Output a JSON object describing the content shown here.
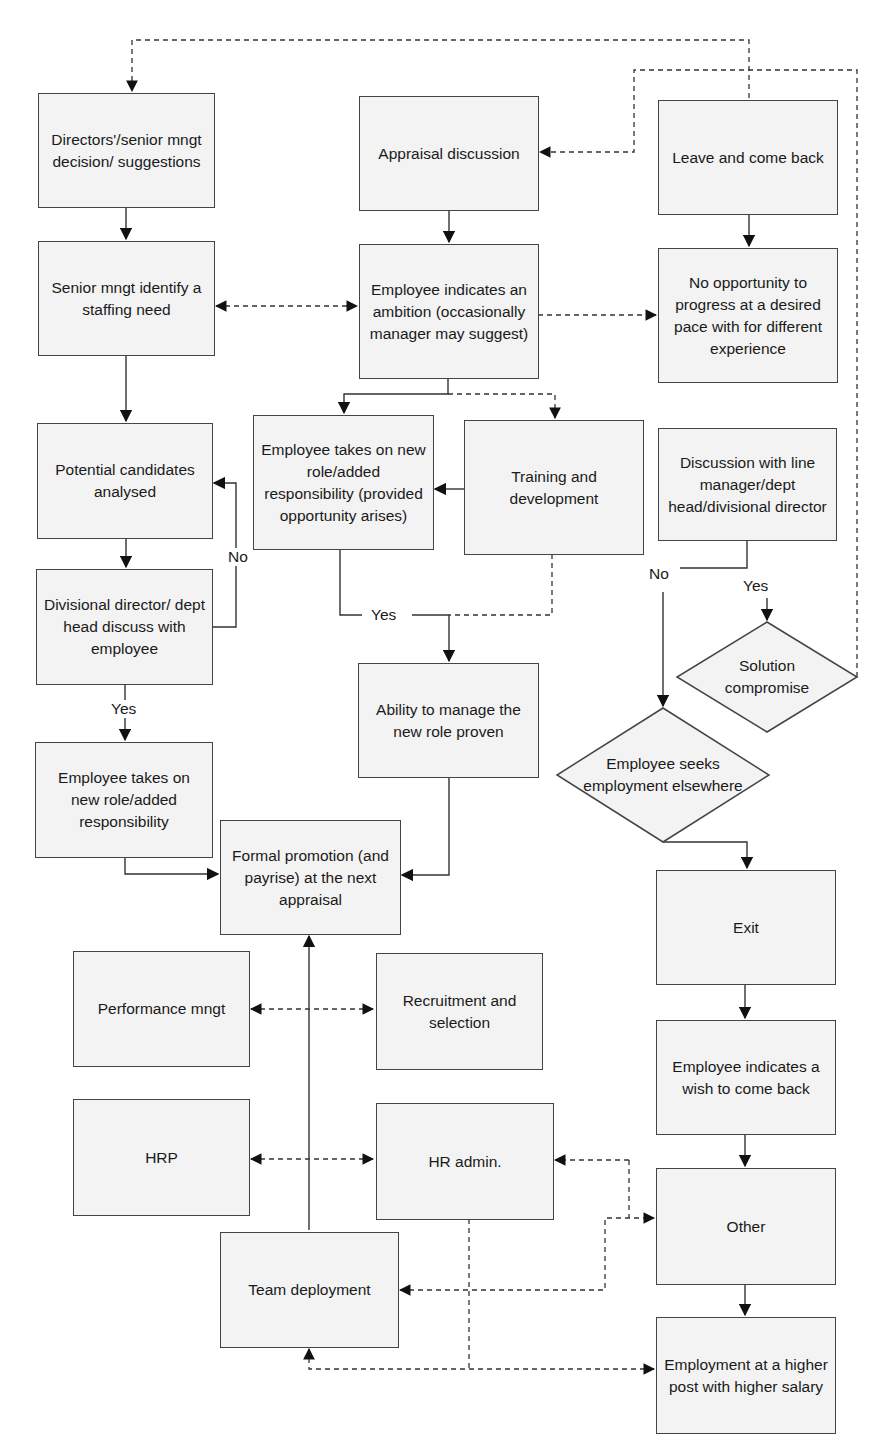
{
  "diagram": {
    "type": "flowchart",
    "nodes": {
      "directors_decision": "Directors'/senior mngt decision/ suggestions",
      "senior_identify_need": "Senior mngt identify a staffing need",
      "appraisal_discussion": "Appraisal discussion",
      "employee_ambition": "Employee indicates an ambition (occasionally manager may suggest)",
      "leave_come_back": "Leave and come back",
      "no_opportunity": "No opportunity to progress at a desired pace with for different experience",
      "potential_candidates": "Potential candidates analysed",
      "takes_on_provided": "Employee takes on new role/added responsibility (provided opportunity arises)",
      "training_development": "Training and development",
      "discussion_line_manager": "Discussion with line manager/dept head/divisional director",
      "divisional_director_discuss": "Divisional director/ dept head discuss with employee",
      "ability_proven": "Ability to manage the new role proven",
      "solution_compromise": "Solution compromise",
      "seeks_elsewhere": "Employee seeks employment elsewhere",
      "takes_on_role": "Employee takes on new role/added responsibility",
      "formal_promotion": "Formal promotion (and payrise) at the next appraisal",
      "exit": "Exit",
      "performance_mngt": "Performance mngt",
      "recruitment_selection": "Recruitment and selection",
      "wish_to_come_back": "Employee indicates a wish to come back",
      "hrp": "HRP",
      "hr_admin": "HR admin.",
      "other": "Other",
      "team_deployment": "Team deployment",
      "higher_post": "Employment at a higher post with higher salary"
    },
    "edge_labels": {
      "no_left": "No",
      "yes_left": "Yes",
      "yes_middle": "Yes",
      "no_right": "No",
      "yes_right": "Yes"
    },
    "colors": {
      "box_fill": "#f3f3f3",
      "line": "#333333"
    }
  }
}
